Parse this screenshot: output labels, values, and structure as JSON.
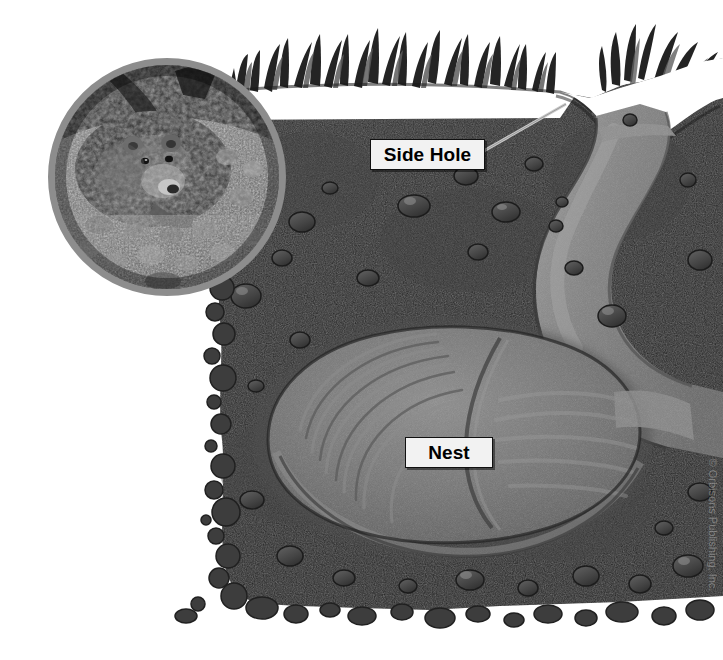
{
  "figure": {
    "background_color": "#ffffff"
  },
  "photo_inset": {
    "name": "bear-in-burrow-photo",
    "alt_text": "Grizzly bear emerging from a gravelly den entrance",
    "border_color": "#8d8d8d",
    "is_grayscale": true
  },
  "callouts": [
    {
      "id": "side-hole",
      "label": "Side Hole",
      "x": 370,
      "y": 139,
      "leader": true
    },
    {
      "id": "nest",
      "label": "Nest",
      "x": 405,
      "y": 437,
      "leader": false
    }
  ],
  "labels": {
    "side_hole": "Side Hole",
    "nest": "Nest"
  },
  "watermark": {
    "text": "© Orbisons Publishing, Inc."
  },
  "palette": {
    "soil_dark": "#272727",
    "soil_mid": "#333333",
    "tunnel_gray": "#7c7c7c",
    "tunnel_light": "#949494",
    "nest_gray": "#6e6e6e",
    "nest_light": "#8a8a8a",
    "pebble": "#4a4a4a",
    "grass_dark": "#1f1f1f",
    "grass_mid": "#5a5a5a",
    "label_bg": "#f2f2f2",
    "label_text": "#000000",
    "page_bg": "#ffffff"
  },
  "scene": {
    "grass_top": "grass silhouette band across top of soil",
    "burrow_entrance": "dip at upper right leading into descending tunnel",
    "tunnel": "light gray tunnel descending from entrance to nest chamber",
    "nest_chamber": "large oval bedding chamber at center",
    "pebble_border": "scattered pebbles along left and bottom edges of soil block"
  }
}
